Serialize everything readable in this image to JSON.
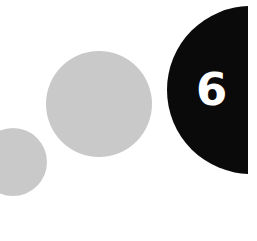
{
  "graphic": {
    "number": "6",
    "colors": {
      "background": "#ffffff",
      "small_circle": "#c9c9c9",
      "medium_circle": "#c9c9c9",
      "large_circle": "#0a0a0a",
      "number_text": "#ffffff"
    }
  }
}
